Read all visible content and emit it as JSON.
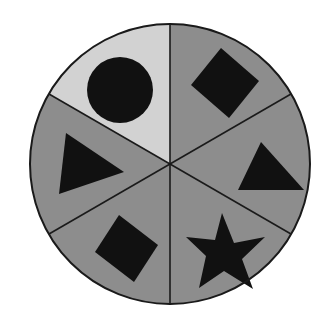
{
  "figure": {
    "background_color": "#ffffff",
    "outline_color": "#1a1a1a",
    "outline_width": 2,
    "divider_color": "#1a1a1a",
    "divider_width": 1.6,
    "shape_color": "#111111",
    "circle": {
      "center_x": 170,
      "center_y": 164,
      "radius": 140
    },
    "sector_count": 6,
    "sector_span_degrees": 60,
    "sector_start_degrees": 90
  },
  "palette": {
    "light_gray": "#d2d2d2",
    "medium_gray": "#8d8d8d",
    "black": "#111111",
    "white": "#ffffff"
  },
  "sectors": [
    {
      "id": "top-left",
      "name": "sector-top-left-circle",
      "position_label": "Top left",
      "fill_name": "light_gray",
      "fill": "#d2d2d2",
      "start_degrees": 90,
      "end_degrees": 150,
      "shape": "circle",
      "shape_label": "Black circle",
      "shape_fill": "#111111",
      "circle": {
        "cx": 120,
        "cy": 90,
        "r": 33
      }
    },
    {
      "id": "top-right",
      "name": "sector-top-right-square",
      "position_label": "Top right",
      "fill_name": "medium_gray",
      "fill": "#8d8d8d",
      "start_degrees": 30,
      "end_degrees": 90,
      "shape": "square-rotated",
      "shape_label": "Black tilted square",
      "shape_fill": "#111111",
      "polygon": "221,48 259,81 229,118 191,85"
    },
    {
      "id": "right",
      "name": "sector-right-triangle-up",
      "position_label": "Right",
      "fill_name": "medium_gray",
      "fill": "#8d8d8d",
      "start_degrees": -30,
      "end_degrees": 30,
      "shape": "triangle-up",
      "shape_label": "Black upward triangle",
      "shape_fill": "#111111",
      "polygon": "261,142 304,190 238,190"
    },
    {
      "id": "bottom-right",
      "name": "sector-bottom-right-star",
      "position_label": "Bottom right",
      "fill_name": "medium_gray",
      "fill": "#8d8d8d",
      "start_degrees": -90,
      "end_degrees": -30,
      "shape": "star-5",
      "shape_label": "Black five-pointed star",
      "shape_fill": "#111111",
      "polygon": "222,213 234,243 265,237 242,259 253,289 224,271 199,288 206,256 186,237 215,240"
    },
    {
      "id": "bottom-left",
      "name": "sector-bottom-left-square",
      "position_label": "Bottom left",
      "fill_name": "medium_gray",
      "fill": "#8d8d8d",
      "start_degrees": -150,
      "end_degrees": -90,
      "shape": "square-rotated",
      "shape_label": "Black tilted square",
      "shape_fill": "#111111",
      "polygon": "119,215 158,245 134,282 95,252"
    },
    {
      "id": "left",
      "name": "sector-left-triangle-right",
      "position_label": "Left",
      "fill_name": "medium_gray",
      "fill": "#8d8d8d",
      "start_degrees": 150,
      "end_degrees": 210,
      "shape": "triangle-right",
      "shape_label": "Black right-pointing triangle",
      "shape_fill": "#111111",
      "polygon": "66,133 124,172 59,194"
    }
  ],
  "dividers": [
    {
      "id": "vertical",
      "name": "divider-vertical",
      "x1": 170,
      "y1": 24,
      "x2": 170,
      "y2": 304
    },
    {
      "id": "diagonal-nw-se",
      "name": "divider-diagonal-nw-se",
      "x1": 49,
      "y1": 94,
      "x2": 291,
      "y2": 234
    },
    {
      "id": "diagonal-ne-sw",
      "name": "divider-diagonal-ne-sw",
      "x1": 291,
      "y1": 94,
      "x2": 49,
      "y2": 234
    }
  ]
}
